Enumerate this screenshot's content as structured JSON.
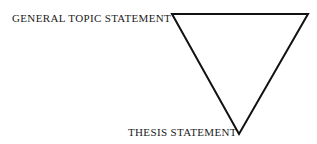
{
  "diagram": {
    "background_color": "#ffffff",
    "stroke_color": "#111111",
    "text_color": "#1a1a1a",
    "labels": {
      "top": "GENERAL TOPIC STATEMENT",
      "bottom": "THESIS STATEMENT"
    },
    "shape": {
      "name": "inverted-triangle",
      "stroke_width": 2,
      "points": "172,14 308,14 239,134",
      "vertices": [
        {
          "name": "top-left",
          "x": 172,
          "y": 14
        },
        {
          "name": "top-right",
          "x": 308,
          "y": 14
        },
        {
          "name": "bottom-apex",
          "x": 239,
          "y": 134
        }
      ]
    }
  }
}
